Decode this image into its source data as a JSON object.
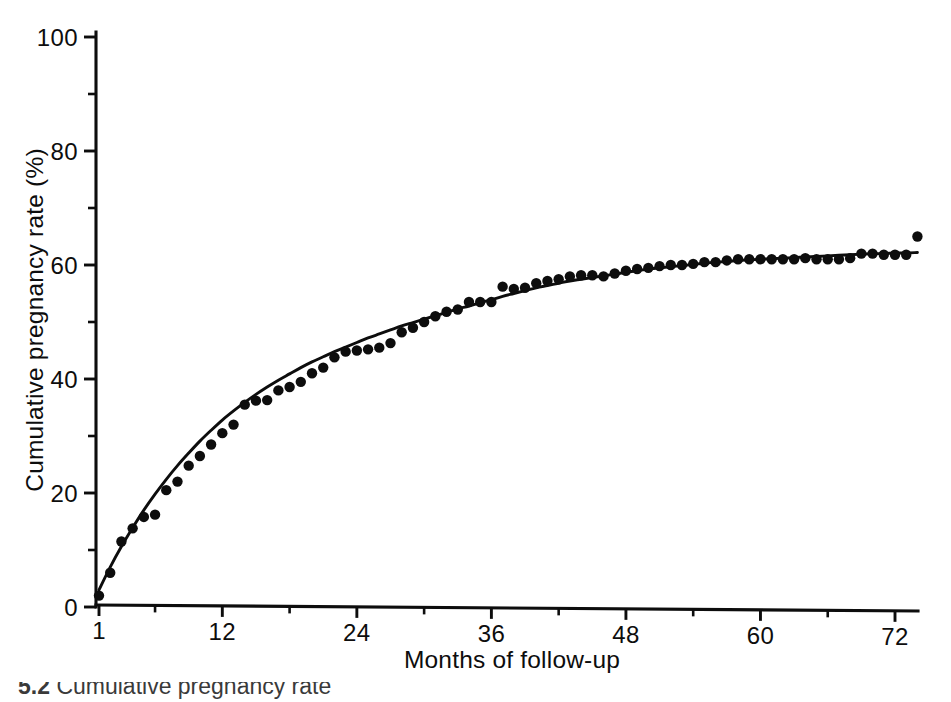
{
  "figure": {
    "caption_label": "5.2",
    "caption_body": "Cumulative pregnancy rate"
  },
  "chart_data": {
    "type": "scatter",
    "title": "",
    "xlabel": "Months of follow-up",
    "ylabel": "Cumulative pregnancy rate (%)",
    "xlim": [
      1,
      74
    ],
    "ylim": [
      0,
      100
    ],
    "grid": false,
    "legend": "none",
    "x_ticks_major": [
      1,
      12,
      24,
      36,
      48,
      60,
      72
    ],
    "x_ticks_major_labels": [
      "1",
      "12",
      "24",
      "36",
      "48",
      "60",
      "72"
    ],
    "x_ticks_minor": [
      6,
      18,
      30,
      42,
      54,
      66
    ],
    "y_ticks_major": [
      0,
      20,
      40,
      60,
      80,
      100
    ],
    "y_ticks_major_labels": [
      "0",
      "20",
      "40",
      "60",
      "80",
      "100"
    ],
    "y_ticks_minor": [
      10,
      30,
      50,
      70,
      90
    ],
    "marker": "filled-circle",
    "marker_color": "#0d0d0d",
    "curve_color": "#0d0d0d",
    "curve_label": "fitted asymptotic curve",
    "series": [
      {
        "name": "Observed cumulative pregnancy rate",
        "points": [
          [
            1,
            2.0
          ],
          [
            2,
            6.0
          ],
          [
            3,
            11.5
          ],
          [
            4,
            13.8
          ],
          [
            5,
            15.8
          ],
          [
            6,
            16.2
          ],
          [
            7,
            20.5
          ],
          [
            8,
            22.0
          ],
          [
            9,
            24.8
          ],
          [
            10,
            26.5
          ],
          [
            11,
            28.5
          ],
          [
            12,
            30.5
          ],
          [
            13,
            32.0
          ],
          [
            14,
            35.5
          ],
          [
            15,
            36.2
          ],
          [
            16,
            36.3
          ],
          [
            17,
            38.0
          ],
          [
            18,
            38.6
          ],
          [
            19,
            39.5
          ],
          [
            20,
            41.0
          ],
          [
            21,
            42.0
          ],
          [
            22,
            43.8
          ],
          [
            23,
            44.8
          ],
          [
            24,
            45.0
          ],
          [
            25,
            45.2
          ],
          [
            26,
            45.5
          ],
          [
            27,
            46.3
          ],
          [
            28,
            48.2
          ],
          [
            29,
            49.0
          ],
          [
            30,
            50.0
          ],
          [
            31,
            51.0
          ],
          [
            32,
            51.8
          ],
          [
            33,
            52.2
          ],
          [
            34,
            53.5
          ],
          [
            35,
            53.5
          ],
          [
            36,
            53.5
          ],
          [
            37,
            56.2
          ],
          [
            38,
            55.8
          ],
          [
            39,
            56.0
          ],
          [
            40,
            56.8
          ],
          [
            41,
            57.2
          ],
          [
            42,
            57.5
          ],
          [
            43,
            58.0
          ],
          [
            44,
            58.2
          ],
          [
            45,
            58.2
          ],
          [
            46,
            58.0
          ],
          [
            47,
            58.5
          ],
          [
            48,
            59.0
          ],
          [
            49,
            59.3
          ],
          [
            50,
            59.5
          ],
          [
            51,
            59.8
          ],
          [
            52,
            60.0
          ],
          [
            53,
            60.0
          ],
          [
            54,
            60.2
          ],
          [
            55,
            60.5
          ],
          [
            56,
            60.5
          ],
          [
            57,
            60.8
          ],
          [
            58,
            61.0
          ],
          [
            59,
            61.0
          ],
          [
            60,
            61.0
          ],
          [
            61,
            61.0
          ],
          [
            62,
            61.0
          ],
          [
            63,
            61.0
          ],
          [
            64,
            61.2
          ],
          [
            65,
            61.0
          ],
          [
            66,
            61.0
          ],
          [
            67,
            61.0
          ],
          [
            68,
            61.2
          ],
          [
            69,
            62.0
          ],
          [
            70,
            62.0
          ],
          [
            71,
            61.8
          ],
          [
            72,
            61.8
          ],
          [
            73,
            61.8
          ],
          [
            74,
            65.0
          ]
        ]
      }
    ],
    "fit_curve": {
      "name": "Fitted curve",
      "description": "Monotonic asymptotic fit approaching about 62 percent",
      "points": [
        [
          1,
          3.0
        ],
        [
          2,
          7.0
        ],
        [
          3,
          10.6
        ],
        [
          4,
          13.9
        ],
        [
          5,
          17.0
        ],
        [
          6,
          19.8
        ],
        [
          7,
          22.4
        ],
        [
          8,
          24.8
        ],
        [
          9,
          27.0
        ],
        [
          10,
          29.1
        ],
        [
          11,
          31.0
        ],
        [
          12,
          32.8
        ],
        [
          13,
          34.4
        ],
        [
          14,
          35.9
        ],
        [
          15,
          37.3
        ],
        [
          16,
          38.6
        ],
        [
          17,
          39.8
        ],
        [
          18,
          40.9
        ],
        [
          19,
          42.0
        ],
        [
          20,
          43.0
        ],
        [
          21,
          43.9
        ],
        [
          22,
          44.8
        ],
        [
          23,
          45.6
        ],
        [
          24,
          46.4
        ],
        [
          25,
          47.2
        ],
        [
          26,
          47.9
        ],
        [
          27,
          48.6
        ],
        [
          28,
          49.3
        ],
        [
          29,
          49.9
        ],
        [
          30,
          50.5
        ],
        [
          31,
          51.1
        ],
        [
          32,
          51.7
        ],
        [
          33,
          52.3
        ],
        [
          34,
          52.8
        ],
        [
          35,
          53.4
        ],
        [
          36,
          53.9
        ],
        [
          37,
          54.5
        ],
        [
          38,
          55.0
        ],
        [
          39,
          55.5
        ],
        [
          40,
          56.0
        ],
        [
          41,
          56.4
        ],
        [
          42,
          56.8
        ],
        [
          43,
          57.2
        ],
        [
          44,
          57.5
        ],
        [
          45,
          57.8
        ],
        [
          46,
          58.1
        ],
        [
          47,
          58.4
        ],
        [
          48,
          58.7
        ],
        [
          49,
          59.0
        ],
        [
          50,
          59.3
        ],
        [
          51,
          59.5
        ],
        [
          52,
          59.7
        ],
        [
          53,
          59.9
        ],
        [
          54,
          60.1
        ],
        [
          55,
          60.3
        ],
        [
          56,
          60.5
        ],
        [
          57,
          60.6
        ],
        [
          58,
          60.8
        ],
        [
          59,
          60.9
        ],
        [
          60,
          61.0
        ],
        [
          61,
          61.1
        ],
        [
          62,
          61.2
        ],
        [
          63,
          61.3
        ],
        [
          64,
          61.4
        ],
        [
          65,
          61.5
        ],
        [
          66,
          61.6
        ],
        [
          67,
          61.7
        ],
        [
          68,
          61.8
        ],
        [
          69,
          61.9
        ],
        [
          70,
          62.0
        ],
        [
          71,
          62.0
        ],
        [
          72,
          62.1
        ],
        [
          73,
          62.1
        ],
        [
          74,
          62.2
        ]
      ]
    }
  }
}
